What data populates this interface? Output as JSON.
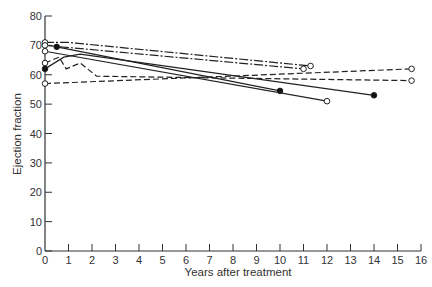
{
  "chart_data": {
    "type": "line",
    "title": "",
    "xlabel": "Years after treatment",
    "ylabel": "Ejection fraction",
    "xlim": [
      0,
      16
    ],
    "ylim": [
      0,
      80
    ],
    "xticks": [
      0,
      1,
      2,
      3,
      4,
      5,
      6,
      7,
      8,
      9,
      10,
      11,
      12,
      13,
      14,
      15,
      16
    ],
    "yticks": [
      0,
      10,
      20,
      30,
      40,
      50,
      60,
      70,
      80
    ],
    "grid": false,
    "legend": null,
    "series": [
      {
        "name": "patient-1",
        "style": "dashdot",
        "points": [
          [
            0,
            71
          ],
          [
            1,
            71
          ],
          [
            11.3,
            63
          ]
        ],
        "start_marker": "open",
        "end_marker": "open"
      },
      {
        "name": "patient-2",
        "style": "dashdot",
        "points": [
          [
            0,
            70
          ],
          [
            11,
            62
          ]
        ],
        "start_marker": "open",
        "end_marker": "open"
      },
      {
        "name": "patient-3",
        "style": "dashed",
        "points": [
          [
            0,
            57
          ],
          [
            15.6,
            62
          ]
        ],
        "start_marker": "open",
        "end_marker": "open"
      },
      {
        "name": "patient-4",
        "style": "dashed",
        "points": [
          [
            0,
            64
          ],
          [
            0.6,
            66
          ],
          [
            0.9,
            62
          ],
          [
            1.5,
            64
          ],
          [
            2.2,
            59.5
          ],
          [
            15.6,
            58
          ]
        ],
        "start_marker": "open",
        "end_marker": "open"
      },
      {
        "name": "patient-5",
        "style": "solid",
        "points": [
          [
            0.5,
            69.5
          ],
          [
            10,
            54.5
          ]
        ],
        "start_marker": "filled",
        "end_marker": "filled"
      },
      {
        "name": "patient-6",
        "style": "solid",
        "points": [
          [
            0,
            68
          ],
          [
            12,
            51
          ]
        ],
        "start_marker": "open",
        "end_marker": "open"
      },
      {
        "name": "patient-7",
        "style": "solid",
        "points": [
          [
            0,
            62
          ],
          [
            0.8,
            66
          ],
          [
            1.5,
            67
          ],
          [
            14,
            53
          ]
        ],
        "start_marker": "filled",
        "end_marker": "filled"
      }
    ]
  },
  "axes": {
    "x_title": "Years after treatment",
    "y_title": "Ejection fraction"
  }
}
